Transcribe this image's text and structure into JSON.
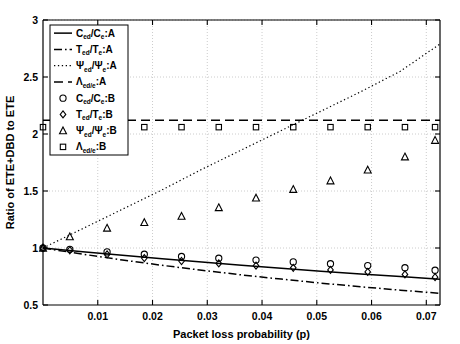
{
  "chart_data": {
    "type": "line",
    "title": "",
    "xlabel": "Packet loss probability (p)",
    "ylabel": "Ratio of ETE+DBD to ETE",
    "xlim": [
      0,
      0.0725
    ],
    "ylim": [
      0.5,
      3
    ],
    "xticks": [
      "0.01",
      "0.02",
      "0.03",
      "0.04",
      "0.05",
      "0.06",
      "0.07"
    ],
    "xtick_values": [
      0.01,
      0.02,
      0.03,
      0.04,
      0.05,
      0.06,
      0.07
    ],
    "yticks": [
      "0.5",
      "1",
      "1.5",
      "2",
      "2.5",
      "3"
    ],
    "ytick_values": [
      0.5,
      1,
      1.5,
      2,
      2.5,
      3
    ],
    "grid": true,
    "grid_style": "dotted",
    "legend_position": "upper-left",
    "series": [
      {
        "name": "C_ed/C_e:A",
        "label_main": "C",
        "label_sub1": "ed",
        "label_mid": "/C",
        "label_sub2": "e",
        "label_tail": ":A",
        "style": "solid",
        "marker": "none",
        "color": "#000000",
        "x": [
          0,
          0.00725,
          0.0145,
          0.02175,
          0.029,
          0.03625,
          0.0435,
          0.05075,
          0.058,
          0.06525,
          0.0725
        ],
        "y": [
          1.0,
          0.968,
          0.936,
          0.906,
          0.877,
          0.849,
          0.822,
          0.797,
          0.772,
          0.749,
          0.726
        ]
      },
      {
        "name": "T_ed/T_e:A",
        "label_main": "T",
        "label_sub1": "ed",
        "label_mid": "/T",
        "label_sub2": "e",
        "label_tail": ":A",
        "style": "dashdot",
        "marker": "none",
        "color": "#000000",
        "x": [
          0,
          0.00725,
          0.0145,
          0.02175,
          0.029,
          0.03625,
          0.0435,
          0.05075,
          0.058,
          0.06525,
          0.0725
        ],
        "y": [
          1.0,
          0.946,
          0.895,
          0.848,
          0.805,
          0.764,
          0.727,
          0.692,
          0.66,
          0.63,
          0.602
        ]
      },
      {
        "name": "Psi_ed/Psi_e:A",
        "label_main": "Ψ",
        "label_sub1": "ed",
        "label_mid": "/Ψ",
        "label_sub2": "e",
        "label_tail": ":A",
        "style": "dotted",
        "marker": "none",
        "color": "#000000",
        "x": [
          0,
          0.00725,
          0.0145,
          0.02175,
          0.029,
          0.03625,
          0.0435,
          0.05075,
          0.058,
          0.06525,
          0.0725
        ],
        "y": [
          1.0,
          1.17,
          1.34,
          1.51,
          1.69,
          1.86,
          2.03,
          2.2,
          2.37,
          2.55,
          2.79
        ]
      },
      {
        "name": "Lambda_ed/e:A",
        "label_main": "Λ",
        "label_sub1": "ed/e",
        "label_mid": "",
        "label_sub2": "",
        "label_tail": ":A",
        "style": "dashed",
        "marker": "none",
        "color": "#000000",
        "x": [
          0,
          0.0725
        ],
        "y": [
          2.12,
          2.12
        ]
      },
      {
        "name": "C_ed/C_e:B",
        "label_main": "C",
        "label_sub1": "ed",
        "label_mid": "/C",
        "label_sub2": "e",
        "label_tail": ":B",
        "style": "none",
        "marker": "circle",
        "color": "#000000",
        "x": [
          0,
          0.0049,
          0.0117,
          0.0185,
          0.0253,
          0.0321,
          0.0389,
          0.0457,
          0.0525,
          0.0593,
          0.0661,
          0.0716
        ],
        "y": [
          1.0,
          0.988,
          0.966,
          0.945,
          0.926,
          0.91,
          0.894,
          0.878,
          0.862,
          0.846,
          0.827,
          0.805
        ]
      },
      {
        "name": "T_ed/T_e:B",
        "label_main": "T",
        "label_sub1": "ed",
        "label_mid": "/T",
        "label_sub2": "e",
        "label_tail": ":B",
        "style": "none",
        "marker": "diamond",
        "color": "#000000",
        "x": [
          0,
          0.0049,
          0.0117,
          0.0185,
          0.0253,
          0.0321,
          0.0389,
          0.0457,
          0.0525,
          0.0593,
          0.0661,
          0.0716
        ],
        "y": [
          1.0,
          0.98,
          0.944,
          0.912,
          0.886,
          0.865,
          0.845,
          0.826,
          0.808,
          0.79,
          0.768,
          0.744
        ]
      },
      {
        "name": "Psi_ed/Psi_e:B",
        "label_main": "Ψ",
        "label_sub1": "ed",
        "label_mid": "/Ψ",
        "label_sub2": "e",
        "label_tail": ":B",
        "style": "none",
        "marker": "triangle",
        "color": "#000000",
        "x": [
          0,
          0.0049,
          0.0117,
          0.0185,
          0.0253,
          0.0321,
          0.0389,
          0.0457,
          0.0525,
          0.0593,
          0.0661,
          0.0716
        ],
        "y": [
          1.0,
          1.1,
          1.175,
          1.225,
          1.28,
          1.355,
          1.44,
          1.515,
          1.59,
          1.685,
          1.8,
          1.945
        ]
      },
      {
        "name": "Lambda_ed/e:B",
        "label_main": "Λ",
        "label_sub1": "ed/e",
        "label_mid": "",
        "label_sub2": "",
        "label_tail": ":B",
        "style": "none",
        "marker": "square",
        "color": "#000000",
        "x": [
          0,
          0.0049,
          0.0117,
          0.0185,
          0.0253,
          0.0321,
          0.0389,
          0.0457,
          0.0525,
          0.0593,
          0.0661,
          0.0716
        ],
        "y": [
          2.06,
          2.06,
          2.06,
          2.06,
          2.06,
          2.06,
          2.06,
          2.06,
          2.06,
          2.06,
          2.06,
          2.06
        ]
      }
    ]
  },
  "axes": {
    "background": "#ffffff",
    "line_color": "#000000",
    "grid_color": "#bfbfbf"
  }
}
